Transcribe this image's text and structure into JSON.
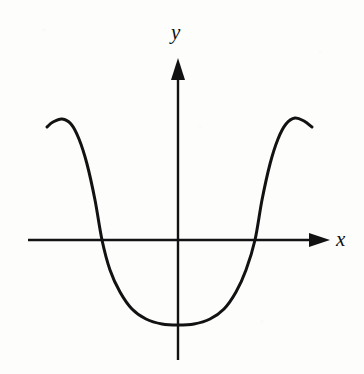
{
  "figure": {
    "kind": "cartesian-graph",
    "background_color": "#fdfdfc",
    "ink_color": "#121212",
    "width": 364,
    "height": 374
  },
  "axes": {
    "x": {
      "label": "x",
      "label_x": 340,
      "label_y": 240,
      "line_y": 240,
      "start_x": 28,
      "end_x": 330,
      "has_arrow_end": true,
      "arrow_direction": "right"
    },
    "y": {
      "label": "y",
      "label_x": 180,
      "label_y": 36,
      "line_x": 178,
      "start_y": 360,
      "end_y": 58,
      "has_arrow_end": true,
      "arrow_direction": "up"
    },
    "origin": {
      "x": 178,
      "y": 240
    }
  },
  "chart_data": {
    "type": "line",
    "title": "",
    "xlabel": "x",
    "ylabel": "y",
    "grid": false,
    "legend": null,
    "axis_arrows": true,
    "stroke_width": 3,
    "stroke_color": "#121212",
    "features": {
      "x_intercepts_px": [
        102,
        255
      ],
      "local_maxima_px": [
        {
          "x": 62,
          "y": 119
        },
        {
          "x": 295,
          "y": 118
        }
      ],
      "local_minimum_px": {
        "x": 178,
        "y": 325
      },
      "y_intercept_px": {
        "x": 178,
        "y": 325
      },
      "left_endpoint_px": {
        "x": 47,
        "y": 127
      },
      "right_endpoint_px": {
        "x": 312,
        "y": 127
      }
    },
    "path_points_px": [
      {
        "x": 47,
        "y": 127
      },
      {
        "x": 53,
        "y": 122
      },
      {
        "x": 62,
        "y": 119
      },
      {
        "x": 71,
        "y": 124
      },
      {
        "x": 79,
        "y": 139
      },
      {
        "x": 87,
        "y": 164
      },
      {
        "x": 95,
        "y": 200
      },
      {
        "x": 102,
        "y": 240
      },
      {
        "x": 110,
        "y": 270
      },
      {
        "x": 120,
        "y": 292
      },
      {
        "x": 132,
        "y": 309
      },
      {
        "x": 146,
        "y": 319
      },
      {
        "x": 162,
        "y": 324
      },
      {
        "x": 178,
        "y": 325
      },
      {
        "x": 194,
        "y": 324
      },
      {
        "x": 210,
        "y": 319
      },
      {
        "x": 224,
        "y": 309
      },
      {
        "x": 236,
        "y": 292
      },
      {
        "x": 246,
        "y": 270
      },
      {
        "x": 255,
        "y": 240
      },
      {
        "x": 262,
        "y": 200
      },
      {
        "x": 270,
        "y": 164
      },
      {
        "x": 278,
        "y": 139
      },
      {
        "x": 286,
        "y": 124
      },
      {
        "x": 295,
        "y": 118
      },
      {
        "x": 304,
        "y": 121
      },
      {
        "x": 312,
        "y": 127
      }
    ]
  }
}
